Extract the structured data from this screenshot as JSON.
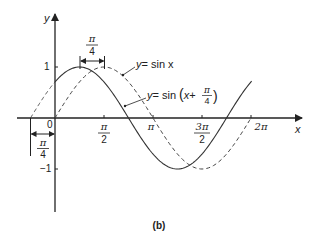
{
  "figure": {
    "caption": "(b)",
    "axes": {
      "x_label": "x",
      "y_label": "y",
      "origin_label": "0",
      "y_ticks": [
        {
          "value": 1,
          "label": "1"
        },
        {
          "value": -1,
          "label": "−1"
        }
      ],
      "x_ticks": [
        {
          "value": "pi/2",
          "num": "π",
          "den": "2"
        },
        {
          "value": "pi",
          "label": "π"
        },
        {
          "value": "3pi/2",
          "num": "3π",
          "den": "2"
        },
        {
          "value": "2pi",
          "label": "2π"
        }
      ]
    },
    "curves": [
      {
        "name": "sin-x",
        "label_lhs": "y",
        "label_rhs": "= sin x",
        "style": "dashed",
        "domain": "0 to 2π"
      },
      {
        "name": "sin-x-plus-pi-over-4",
        "label_lhs": "y",
        "label_mid": "= sin",
        "label_x": "x",
        "label_plus": "+",
        "frac_num": "π",
        "frac_den": "4",
        "style": "solid",
        "domain": "−π/4 to 2π"
      }
    ],
    "annotations": {
      "phase_shift_top": {
        "num": "π",
        "den": "4"
      },
      "phase_shift_left": {
        "num": "π",
        "den": "4"
      }
    }
  }
}
